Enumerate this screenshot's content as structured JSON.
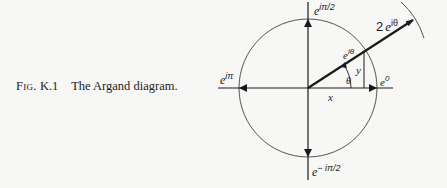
{
  "caption": {
    "fig_label": "Fig.",
    "fig_number": "K.1",
    "text": "The Argand diagram."
  },
  "diagram": {
    "title": "Argand diagram",
    "unit_circle": {
      "center": [
        308,
        88
      ],
      "radius": 69
    },
    "outer_arc_label": "radius 2",
    "labels": {
      "top": {
        "base": "e",
        "exp": "iπ/2"
      },
      "bottom": {
        "base": "e",
        "exp": "− iπ/2"
      },
      "left": {
        "base": "e",
        "exp": "iπ"
      },
      "right": {
        "base": "e",
        "exp": "0"
      },
      "on_circle": {
        "base": "e",
        "exp": "iθ"
      },
      "radial_tip": {
        "coef": "2",
        "base": "e",
        "exp": "iθ"
      },
      "x": "x",
      "y": "y",
      "theta": "θ"
    },
    "colors": {
      "axis": "#1a1a1a",
      "circle": "#555555",
      "text": "#222222",
      "background": "#f7f7f5"
    }
  }
}
